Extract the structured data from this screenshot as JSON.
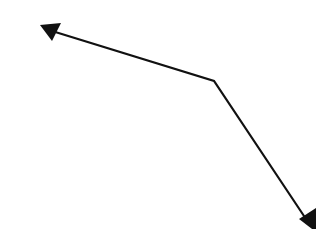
{
  "diagram": {
    "background": "#ffffff",
    "stroke_color": "#111111",
    "stroke_width": 2.2,
    "polyline": {
      "points": [
        [
          52,
          31
        ],
        [
          214,
          81
        ],
        [
          306,
          219
        ]
      ]
    },
    "arrowheads": [
      {
        "name": "arrowhead-upper-left",
        "tip": [
          40,
          25
        ],
        "base_a": [
          61,
          23
        ],
        "base_b": [
          52,
          41
        ]
      },
      {
        "name": "arrowhead-lower-right",
        "tip": [
          316,
          232
        ],
        "base_a": [
          299,
          219
        ],
        "base_b": [
          316,
          208
        ]
      }
    ]
  }
}
